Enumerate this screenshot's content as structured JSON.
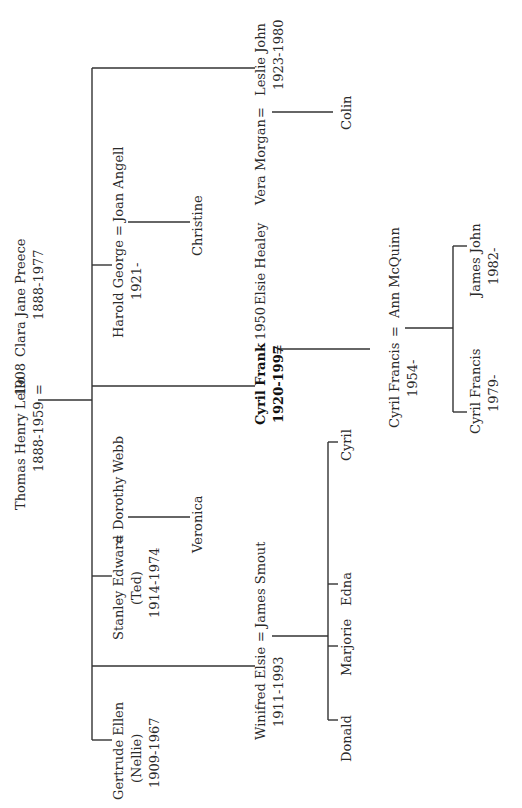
{
  "orientation": "rotated 90 degrees counter-clockwise (text reads bottom-to-top)",
  "colors": {
    "background": "#ffffff",
    "text": "#2a2a2a",
    "lines": "#333333"
  },
  "generation1": {
    "husband": {
      "name": "Thomas Henry Lello",
      "dates": "1888-1959"
    },
    "marriage_year": "1908",
    "marriage_symbol": "=",
    "wife": {
      "name": "Clara Jane Preece",
      "dates": "1888-1977"
    }
  },
  "generation2": [
    {
      "name": "Gertrude Ellen",
      "nickname": "(Nellie)",
      "dates": "1909-1967"
    },
    {
      "name": "Stanley Edward",
      "nickname": "(Ted)",
      "dates": "1914-1974",
      "spouse": "Dorothy Webb",
      "symbol": "=",
      "children": [
        "Veronica"
      ]
    },
    {
      "name": "Harold George",
      "dates": "1921-",
      "spouse": "Joan Angell",
      "symbol": "=",
      "children": [
        "Christine"
      ]
    },
    {
      "name": "Winifred Elsie",
      "dates": "1911-1993",
      "spouse": "James Smout",
      "symbol": "=",
      "children": [
        "Donald",
        "Marjorie",
        "Edna",
        "Cyril"
      ]
    },
    {
      "name": "Cyril Frank",
      "dates": "1920-1997",
      "highlighted": true,
      "marriage_year": "1950",
      "spouse": "Elsie Healey",
      "symbol": "="
    },
    {
      "name": "Leslie John",
      "dates": "1923-1980",
      "spouse": "Vera Morgan",
      "symbol": "=",
      "children": [
        "Colin"
      ]
    }
  ],
  "generation3": {
    "cyril_francis": {
      "name": "Cyril Francis",
      "dates": "1954-",
      "spouse": "Ann McQuinn",
      "symbol": "="
    }
  },
  "generation4": [
    {
      "name": "Cyril Francis",
      "dates": "1979-"
    },
    {
      "name": "James John",
      "dates": "1982-"
    }
  ]
}
